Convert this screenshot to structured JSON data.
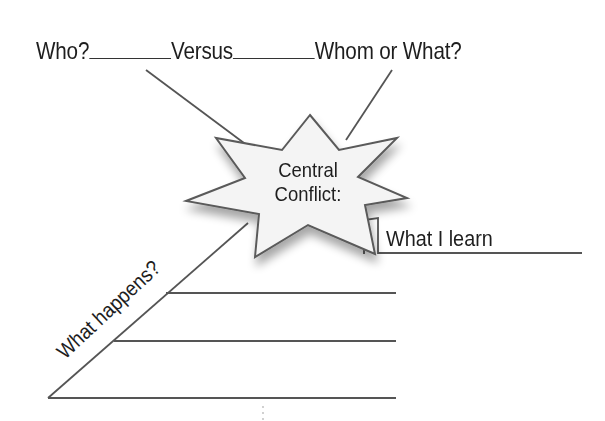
{
  "header": {
    "who_label": "Who?",
    "versus_label": "Versus",
    "whom_label": "Whom or What?"
  },
  "center": {
    "line1": "Central",
    "line2": "Conflict:"
  },
  "learn": {
    "label": "What I learn"
  },
  "happens": {
    "label": "What happens?"
  },
  "colors": {
    "line": "#555555",
    "text": "#1e1e1e",
    "star_fill": "#f4f4f4",
    "star_stroke": "#5a5a5a"
  }
}
